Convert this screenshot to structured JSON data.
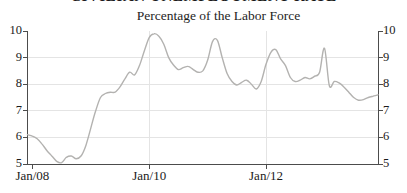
{
  "window": {
    "background": "#ffffff"
  },
  "header": {
    "cropped_title": "CIVILIAN UNEMPLOYMENT RATE",
    "subtitle": "Percentage of the Labor Force"
  },
  "chart_data": {
    "type": "line",
    "title": "Percentage of the Labor Force",
    "xlabel": "",
    "ylabel": "",
    "ylim": [
      5,
      10
    ],
    "y_tick_labels": [
      "10",
      "9",
      "8",
      "7",
      "6",
      "5"
    ],
    "x_tick_labels": [
      "Jan/08",
      "Jan/10",
      "Jan/12"
    ],
    "x_range": "Dec/07 to Dec/13, monthly",
    "grid": true,
    "legend": "none",
    "axes": "left, right and bottom with outward ticks",
    "series": [
      {
        "name": "percentage-of-labor-force",
        "values": [
          6.1,
          6.05,
          5.95,
          5.75,
          5.5,
          5.3,
          5.1,
          5.05,
          5.25,
          5.3,
          5.2,
          5.3,
          5.7,
          6.35,
          7.0,
          7.5,
          7.65,
          7.7,
          7.7,
          7.9,
          8.2,
          8.45,
          8.35,
          8.7,
          9.25,
          9.75,
          9.9,
          9.8,
          9.5,
          9.0,
          8.72,
          8.55,
          8.62,
          8.67,
          8.56,
          8.45,
          8.5,
          8.9,
          9.6,
          9.65,
          9.0,
          8.4,
          8.1,
          7.97,
          8.07,
          8.15,
          8.0,
          7.82,
          8.1,
          8.75,
          9.2,
          9.3,
          8.95,
          8.7,
          8.25,
          8.1,
          8.15,
          8.25,
          8.2,
          8.3,
          8.45,
          9.35,
          7.95,
          8.1,
          8.05,
          7.9,
          7.7,
          7.5,
          7.4,
          7.42,
          7.5,
          7.55,
          7.6
        ]
      }
    ],
    "colors": {
      "line": "#b3b2b0",
      "grid": "#e4e4e4",
      "axis": "#4c4c4c",
      "text": "#1b1b1b"
    }
  }
}
